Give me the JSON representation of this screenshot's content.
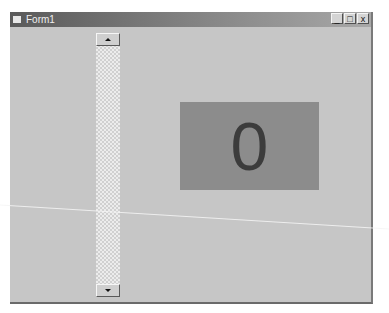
{
  "window": {
    "title": "Form1",
    "caption_buttons": {
      "minimize": "_",
      "maximize": "□",
      "close": "x"
    }
  },
  "scrollbar": {
    "orientation": "vertical",
    "up_icon": "arrow-up-icon",
    "down_icon": "arrow-down-icon"
  },
  "display": {
    "value": "0"
  },
  "colors": {
    "titlebar": "#5a5a5a",
    "client": "#c6c6c6",
    "display_bg": "#8c8c8c",
    "display_text": "#3c3c3c"
  }
}
